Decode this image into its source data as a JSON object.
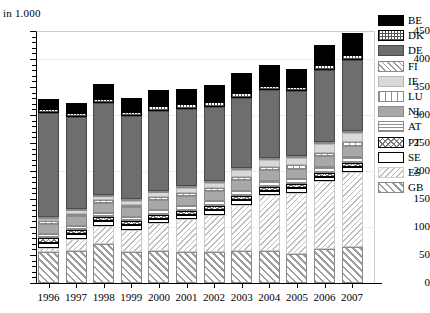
{
  "axis_unit_label": "in 1.000",
  "title": "",
  "chart_data": {
    "type": "bar",
    "subtype": "stacked",
    "title": "",
    "xlabel": "",
    "ylabel": "in 1.000",
    "ylim": [
      0,
      450
    ],
    "yticks": [
      0,
      50,
      100,
      150,
      200,
      250,
      300,
      350,
      400,
      450
    ],
    "grid": true,
    "legend_position": "right",
    "categories": [
      "1996",
      "1997",
      "1998",
      "1999",
      "2000",
      "2001",
      "2002",
      "2003",
      "2004",
      "2005",
      "2006",
      "2007"
    ],
    "series": [
      {
        "name": "GB",
        "pattern": "diagonal-hatch-coarse",
        "values": [
          55,
          57,
          70,
          55,
          57,
          56,
          56,
          57,
          57,
          51,
          60,
          65
        ]
      },
      {
        "name": "ES",
        "pattern": "diagonal-hatch-fine",
        "values": [
          7,
          22,
          32,
          40,
          50,
          58,
          66,
          83,
          100,
          110,
          122,
          134
        ]
      },
      {
        "name": "SE",
        "pattern": "blank",
        "values": [
          10,
          8,
          8,
          8,
          8,
          8,
          8,
          8,
          8,
          8,
          8,
          8
        ]
      },
      {
        "name": "PT",
        "pattern": "cross-diamond",
        "values": [
          8,
          7,
          7,
          7,
          7,
          7,
          7,
          7,
          7,
          7,
          7,
          7
        ]
      },
      {
        "name": "AT",
        "pattern": "horizontal-lines",
        "values": [
          8,
          8,
          8,
          8,
          9,
          9,
          9,
          10,
          10,
          10,
          11,
          11
        ]
      },
      {
        "name": "NL",
        "pattern": "solid-mid-gray",
        "values": [
          17,
          17,
          18,
          17,
          18,
          18,
          18,
          19,
          19,
          18,
          19,
          20
        ]
      },
      {
        "name": "LU",
        "pattern": "vertical-lines",
        "values": [
          5,
          5,
          5,
          5,
          5,
          5,
          5,
          6,
          6,
          6,
          6,
          6
        ]
      },
      {
        "name": "IE",
        "pattern": "solid-light-gray",
        "values": [
          5,
          6,
          7,
          7,
          8,
          9,
          10,
          12,
          13,
          13,
          15,
          17
        ]
      },
      {
        "name": "FI",
        "pattern": "diagonal-hatch-light",
        "values": [
          3,
          3,
          3,
          3,
          3,
          3,
          3,
          4,
          4,
          4,
          4,
          4
        ]
      },
      {
        "name": "DE",
        "pattern": "solid-dark-gray",
        "values": [
          185,
          163,
          163,
          148,
          143,
          138,
          133,
          125,
          120,
          115,
          128,
          126
        ]
      },
      {
        "name": "DK",
        "pattern": "fine-grid",
        "values": [
          8,
          8,
          8,
          8,
          8,
          8,
          8,
          8,
          8,
          8,
          9,
          9
        ]
      },
      {
        "name": "BE",
        "pattern": "solid-black",
        "values": [
          17,
          18,
          26,
          24,
          29,
          28,
          31,
          36,
          38,
          33,
          36,
          40
        ]
      }
    ],
    "totals": [
      328,
      322,
      355,
      330,
      345,
      347,
      354,
      375,
      390,
      383,
      425,
      447
    ]
  },
  "legend": {
    "items": [
      {
        "label": "BE"
      },
      {
        "label": "DK"
      },
      {
        "label": "DE"
      },
      {
        "label": "FI"
      },
      {
        "label": "IE"
      },
      {
        "label": "LU"
      },
      {
        "label": "NL"
      },
      {
        "label": "AT"
      },
      {
        "label": "PT"
      },
      {
        "label": "SE"
      },
      {
        "label": "ES"
      },
      {
        "label": "GB"
      }
    ]
  }
}
